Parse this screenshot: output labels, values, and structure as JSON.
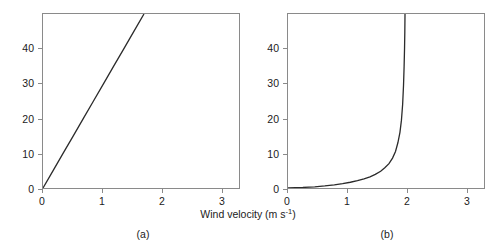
{
  "figure": {
    "axis_title_x": "Wind velocity (m s",
    "axis_title_x_sup": "-1",
    "axis_title_x_close": ")",
    "axis_title_y": "Height (mm)",
    "caption_a": "(a)",
    "caption_b": "(b)",
    "line_color": "#2b2b2b",
    "frame_color": "#8a8a8a",
    "background_color": "#ffffff"
  },
  "chart_data": [
    {
      "type": "line",
      "panel": "a",
      "title": "",
      "xlabel": "Wind velocity (m s-1)",
      "ylabel": "Height (mm)",
      "xlim": [
        0,
        3.3
      ],
      "ylim": [
        0,
        50
      ],
      "xticks": [
        0,
        1,
        2,
        3
      ],
      "xtick_labels": [
        "0",
        "1",
        "2",
        "3"
      ],
      "yticks": [
        0,
        10,
        20,
        30,
        40
      ],
      "ytick_labels": [
        "0",
        "10",
        "20",
        "30",
        "40"
      ],
      "grid": false,
      "legend": false,
      "series": [
        {
          "name": "linear wind profile",
          "x": [
            0,
            0.17,
            0.34,
            0.51,
            0.68,
            0.85,
            1.02,
            1.19,
            1.36,
            1.53,
            1.7
          ],
          "y": [
            0,
            5,
            10,
            15,
            20,
            25,
            30,
            35,
            40,
            45,
            50
          ]
        }
      ]
    },
    {
      "type": "line",
      "panel": "b",
      "title": "",
      "xlabel": "Wind velocity (m s-1)",
      "ylabel": "Height (mm)",
      "xlim": [
        0,
        3.3
      ],
      "ylim": [
        0,
        50
      ],
      "xticks": [
        0,
        1,
        2,
        3
      ],
      "xtick_labels": [
        "0",
        "1",
        "2",
        "3"
      ],
      "yticks": [
        0,
        10,
        20,
        30,
        40
      ],
      "ytick_labels": [
        "0",
        "10",
        "20",
        "30",
        "40"
      ],
      "grid": false,
      "legend": false,
      "series": [
        {
          "name": "logarithmic wind profile",
          "x": [
            0.0,
            0.25,
            0.45,
            0.62,
            0.78,
            0.92,
            1.05,
            1.17,
            1.28,
            1.38,
            1.47,
            1.56,
            1.63,
            1.7,
            1.76,
            1.81,
            1.85,
            1.885,
            1.91,
            1.93,
            1.945,
            1.955,
            1.962,
            1.967,
            1.97
          ],
          "y": [
            0.0,
            0.15,
            0.35,
            0.6,
            0.9,
            1.25,
            1.65,
            2.1,
            2.6,
            3.2,
            3.9,
            4.8,
            5.8,
            7.0,
            8.6,
            10.5,
            13.0,
            16.0,
            19.5,
            24.0,
            29.5,
            35.0,
            40.0,
            45.0,
            50.0
          ]
        }
      ]
    }
  ]
}
